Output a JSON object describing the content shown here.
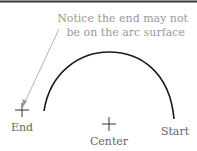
{
  "diagram": {
    "annotation": {
      "line1": "Notice the end may not",
      "line2": "be on the arc surface"
    },
    "labels": {
      "end": "End",
      "center": "Center",
      "start": "Start"
    },
    "colors": {
      "arc": "#1a1a1a",
      "marker": "#333333",
      "label": "#666666",
      "annotation": "#999999",
      "leader": "#aaaaaa",
      "border": "#333333"
    }
  }
}
